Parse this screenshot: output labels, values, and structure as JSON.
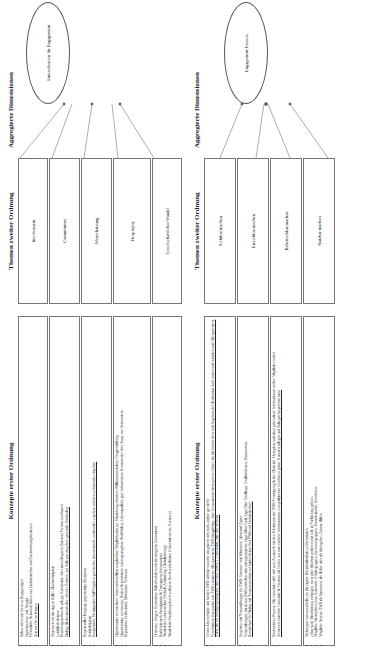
{
  "headers": {
    "first_order": "Konzepte erster Ordnung",
    "second_order": "Themen zweiter Ordnung",
    "aggregate": "Aggregierte Dimensionen"
  },
  "panel1": {
    "aggregate": "Antezedenzien für Engagement",
    "themes": [
      {
        "label": "Involvement",
        "concepts": [
          "Selber offen sein für neue Begegnungen",
          "Eigeninteresse und Neugier",
          "Persönliche Bekanntschaften von Einheimischen und Zweitwohnungsbesitzern",
          "Zeit vor Ort verbringen"
        ]
      },
      {
        "label": "Commitment",
        "concepts": [
          "Awareness für die eigene Rolle; Glaubwürdigkeit",
          "Leitbild definieren",
          "Beziehungsaufbau & -pflege; Kontinuität; über einen längeren Zeitraum Vertrauen aufbauen",
          "Dialog; Diskussionskultur, offenes Zuhören, auf Anliegen eingehen; gemeinde Streitkultur"
        ]
      },
      {
        "label": "Wertschätzung",
        "concepts": [
          "Respektvoller Umgang; gegenseitige Akzeptanz",
          "Kritikfähigkeit",
          "Kooperation; Partizipativer Stil/Vorgehen gewünscht; demokratisch; aufeinander zugehen; zuhören; aufeinander eingehen"
        ]
      },
      {
        "label": "Hospitality",
        "concepts": [
          "Opportunities to contribute: Interessenkonflikte ausgleichen; Möglichkeiten zur Mitwirkung schaffen; Willkommenskultur; Gruppenbildung",
          "Opportunities to consume: Breites & attraktives Leistungsangebot; Wohlfühlen; Lebensqualität; gute Infrastruktur; Kenntnis des Orts; Sorge vor Overtourism",
          "Reputation; Exklusivität; Diskretion; Vertrauen"
        ]
      },
      {
        "label": "Gesellschaftlicher Wandel",
        "concepts": [
          "Ortsnutze, Jüngere Generation; Weltoffenheit (auch der jüngeren Generation)",
          "Bedürfnis nach Partizipation & Transparenz (Information)",
          "Wandel der Lebenswelten (Verhalt, Anbindung, Globalisierung)",
          "Wandel der Beziehung durch verlorene Rechtsverhältnisse (Gemeindesteuer, Kurtaxen)"
        ]
      }
    ]
  },
  "panel2": {
    "aggregate": "Engagement-Prozess",
    "themes": [
      {
        "label": "Sichtbar machen",
        "concepts": [
          "Grosse Unterschiede und bei den ZWB sichtbar: manche integrieren sich stark, andere gar nicht",
          "Verschiedene Kategorien von ZWB existieren: Altergenerierte ZWB (langjährige, über Generationen hinweg treue Gäste), die die Infrastruktur und Angebote der Destination stark nutzen und mitreden und; Altergenerierte ZWB, die für Bewegung kämpfen; aber neue ZWB (1. Generation), die sehr rasch ist"
        ]
      },
      {
        "label": "Erreichbar machen",
        "concepts": [
          "Angebote und Veranstaltungen für ZWB: Sommer- und Winterfest, Jahrwand-Apero",
          "Veranstaltungen, bei denen ZWB mithelfen oder mitorganisieren: Eiger Ultra Trail, Eiger Bike Challenge, Freilichttheater, Strassenfeste",
          "Bereitschaft für Dialog und Zusammenarbeit auf beiden Seiten (bei ZWB und Einheimischen)"
        ]
      },
      {
        "label": "Beherrschbar machen",
        "concepts": [
          "Strukturierter Prozess: Die Gemeinde trifft sich zum Austausch mit den Präsidenten der ZWB-Vereinigung & des Clubs der Ehrengäste und diese geben diese Informationen an ihre Mitglieder weiter",
          "Austausch zwischen Gemeinde & Vereinen als Gefäss, wo man vertiefte Informationen zum politischen Geschehen geben, Kontakte pflegen und Anliegen besprechen kann"
        ]
      },
      {
        "label": "Nutzbar machen",
        "concepts": [
          "Meinungen von ausserhalb, um die eigene Betriebsblindheit zu überwinden",
          "«Man kann Mitarbeitung verlangen, muss aber Mitarbeit anbieten und evtl. in Vorleistung gehen.»",
          "Mögliche Massnahmen zum Austausch: Arbeitsgruppen, Interessengruppen, Kommissionen, Ausschüsse",
          "Mögliche Nutzen: ZWB als Sponsoren, als Helfer oder als Ideengeber; Corona-Hilfen"
        ]
      }
    ]
  }
}
